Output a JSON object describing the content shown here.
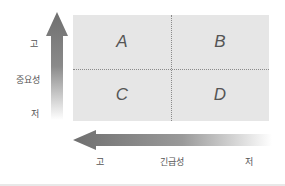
{
  "quadrants": [
    {
      "label": "A"
    },
    {
      "label": "B"
    },
    {
      "label": "C"
    },
    {
      "label": "D"
    }
  ],
  "y_axis": {
    "title": "중요성",
    "high": "고",
    "low": "저",
    "direction": "up"
  },
  "x_axis": {
    "title": "긴급성",
    "high": "고",
    "low": "저",
    "direction": "left"
  },
  "colors": {
    "grid_fill": "#e6e6e6",
    "divider": "#8a8a8a",
    "arrow_dark": "#6f6f6f",
    "text": "#555555"
  }
}
